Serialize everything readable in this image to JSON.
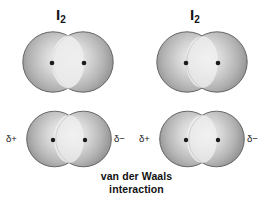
{
  "figure": {
    "background_color": "#ffffff",
    "width": 273,
    "height": 207
  },
  "labels": {
    "molecule_left_element": "I",
    "molecule_left_subscript": "2",
    "molecule_right_element": "I",
    "molecule_right_subscript": "2"
  },
  "charges": {
    "left_molecule_positive": "δ+",
    "left_molecule_negative": "δ−",
    "right_molecule_positive": "δ+",
    "right_molecule_negative": "δ−"
  },
  "caption": {
    "line1": "van der Waals",
    "line2": "interaction"
  },
  "colors": {
    "sphere_edge": "#8d8d8d",
    "sphere_mid": "#b6b6b6",
    "sphere_highlight": "#f2f2f2",
    "outline": "#4a4a4a",
    "nucleus": "#1b1b1b",
    "text": "#141414"
  },
  "diagram_data": {
    "type": "molecular-interaction-diagram",
    "molecule_formula": "I2",
    "rows": [
      {
        "row": "top",
        "description": "Two nonpolar I2 molecules, no induced dipole shown",
        "molecules": 2,
        "labelled": true,
        "charges_shown": false
      },
      {
        "row": "bottom",
        "description": "Same two I2 molecules with instantaneous induced dipoles",
        "molecules": 2,
        "labelled": false,
        "charges_shown": true,
        "charge_order": [
          "δ+",
          "δ−",
          "δ+",
          "δ−"
        ]
      }
    ],
    "atoms_per_molecule": 2
  }
}
